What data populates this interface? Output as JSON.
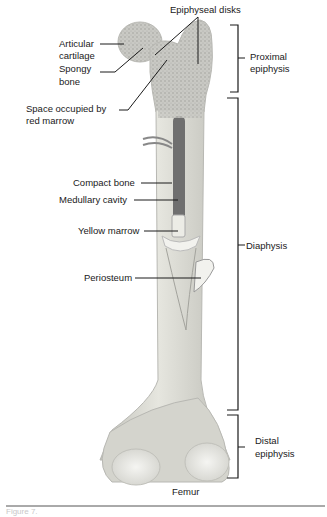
{
  "figure": {
    "title": "Femur",
    "caption_partial": "Figure 7.",
    "labels": {
      "epiphyseal_disks": "Epiphyseal disks",
      "articular_cartilage_1": "Articular",
      "articular_cartilage_2": "cartilage",
      "spongy_bone_1": "Spongy",
      "spongy_bone_2": "bone",
      "red_marrow_1": "Space occupied by",
      "red_marrow_2": "red marrow",
      "compact_bone": "Compact bone",
      "medullary_cavity": "Medullary cavity",
      "yellow_marrow": "Yellow marrow",
      "periosteum": "Periosteum"
    },
    "regions": {
      "proximal_1": "Proximal",
      "proximal_2": "epiphysis",
      "diaphysis": "Diaphysis",
      "distal_1": "Distal",
      "distal_2": "epiphysis"
    },
    "colors": {
      "bone": "#d9d9d2",
      "bone_shade": "#b9b9b2",
      "spongy": "#c4c4c0",
      "marrow_red": "#6e6e6e",
      "cartilage": "#ecece8",
      "line": "#1a1a1a"
    }
  }
}
